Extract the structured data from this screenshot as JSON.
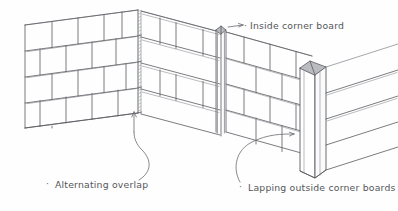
{
  "figure": {
    "type": "architectural-line-drawing",
    "background_color": "#fefefe",
    "line_color": "#5a5b60",
    "shade_color": "#8e9096",
    "text_color": "#55565a"
  },
  "labels": {
    "inside_corner": "Inside corner board",
    "alternating_overlap": "Alternating overlap",
    "lapping_outside": "Lapping outside corner boards",
    "bullet": "·"
  },
  "annotations": [
    {
      "name": "inside-corner-board",
      "text": "Inside corner board",
      "arrow": "right",
      "target": "top of inside corner board"
    },
    {
      "name": "alternating-overlap",
      "text": "Alternating overlap",
      "arrow": "up",
      "target": "outside corner of left wall"
    },
    {
      "name": "lapping-outside-corner-boards",
      "text": "Lapping outside corner boards",
      "arrow": "right",
      "target": "outside corner boards at right"
    }
  ],
  "walls": [
    {
      "name": "left-wall",
      "courses": 5,
      "slope": "up-to-right",
      "finish": "shingles"
    },
    {
      "name": "middle-wall",
      "courses": 4,
      "slope": "down-to-left",
      "finish": "shingles"
    },
    {
      "name": "right-wall",
      "courses": 4,
      "slope": "down-to-right",
      "finish": "shingles"
    },
    {
      "name": "far-right-wall",
      "courses": 4,
      "slope": "up-to-right",
      "finish": "shingles"
    }
  ],
  "corners": [
    {
      "name": "outside-corner-left",
      "x": 138,
      "detail": "alternating shingle overlap, no corner board"
    },
    {
      "name": "inside-corner",
      "x": 220,
      "detail": "vertical inside corner board"
    },
    {
      "name": "outside-corner-right",
      "x": 310,
      "detail": "lapped outside corner boards"
    }
  ]
}
